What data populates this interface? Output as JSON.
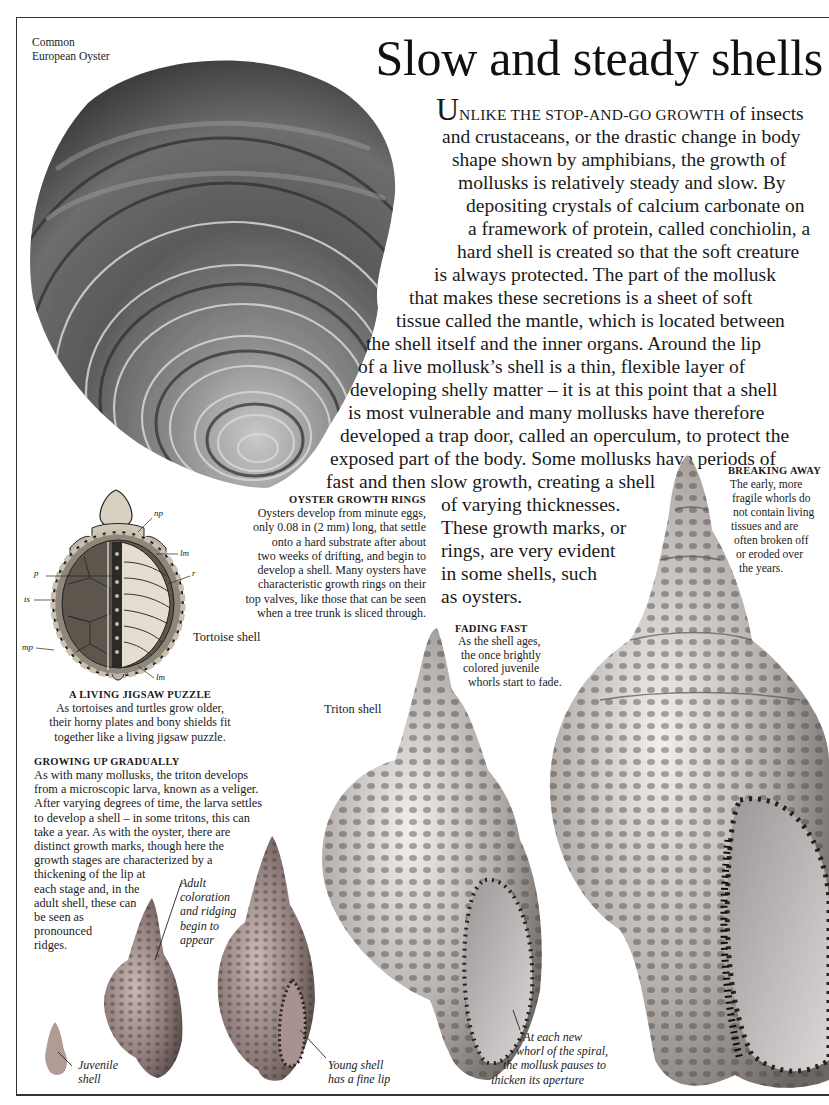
{
  "page": {
    "title": "Slow and steady shells",
    "border_color": "#333333"
  },
  "oyster": {
    "label_line1": "Common",
    "label_line2": "European Oyster"
  },
  "intro": {
    "dropcap": "U",
    "smallcaps_lead": "NLIKE THE STOP-AND-GO GROWTH",
    "lines": [
      " of insects",
      "and crustaceans, or the drastic change in body",
      "shape shown by amphibians, the growth of",
      "mollusks is relatively steady and slow. By",
      "depositing crystals of calcium carbonate on",
      "a framework of protein, called conchiolin, a",
      "hard shell is created so that the soft creature",
      "is always protected. The part of the mollusk",
      "that makes these secretions is a sheet of soft",
      "tissue called the mantle, which is located between",
      "the shell itself and the inner organs. Around the lip",
      "of a live mollusk’s shell is a thin, flexible layer of",
      "developing shelly matter – it is at this point that a shell",
      "is most vulnerable and many mollusks have therefore",
      "developed a trap door, called an operculum, to protect the",
      "exposed part of the body. Some mollusks have periods of",
      "fast and then slow growth, creating a shell",
      "of varying thicknesses.",
      "These growth marks, or",
      "rings, are very evident",
      "in some shells, such",
      "as oysters."
    ]
  },
  "oyster_growth_rings": {
    "heading": "OYSTER GROWTH RINGS",
    "lines": [
      "Oysters develop from minute eggs,",
      "only 0.08 in (2 mm) long, that settle",
      "onto a hard substrate after about",
      "two weeks of drifting, and begin to",
      "develop a shell. Many oysters have",
      "characteristic growth rings on their",
      "top valves, like those that can be seen",
      "when a tree trunk is sliced through."
    ]
  },
  "breaking_away": {
    "heading": "BREAKING AWAY",
    "lines": [
      "The early, more",
      "fragile whorls do",
      "not contain living",
      "tissues and are",
      "often broken off",
      "or eroded over",
      "the years."
    ]
  },
  "tortoise": {
    "caption": "Tortoise shell",
    "labels": {
      "np": "np",
      "lm_top": "lm",
      "p": "p",
      "r": "r",
      "ts": "ts",
      "mp": "mp",
      "lm_bottom": "lm"
    }
  },
  "living_jigsaw": {
    "heading": "A LIVING JIGSAW PUZZLE",
    "lines": [
      "As tortoises and turtles grow older,",
      "their horny plates and bony shields fit",
      "together like a living jigsaw puzzle."
    ]
  },
  "fading_fast": {
    "heading": "FADING FAST",
    "lines": [
      "As the shell ages,",
      "the once brightly",
      "colored juvenile",
      "whorls start to fade."
    ]
  },
  "triton": {
    "caption": "Triton shell"
  },
  "growing_up": {
    "heading": "GROWING UP GRADUALLY",
    "lines": [
      "As with many mollusks, the triton develops",
      "from a microscopic larva, known as a veliger.",
      "After varying degrees of time, the larva settles",
      "to develop a shell – in some tritons, this can",
      "take a year. As with the oyster, there are",
      "distinct growth marks, though here the",
      "growth stages are characterized by a",
      "thickening of the lip at",
      "each stage and, in the",
      "adult shell, these can",
      "be seen as",
      "pronounced",
      "ridges."
    ]
  },
  "annotations": {
    "adult_coloration": [
      "Adult",
      "coloration",
      "and ridging",
      "begin to",
      "appear"
    ],
    "juvenile": [
      "Juvenile",
      "shell"
    ],
    "young_shell": [
      "Young shell",
      "has a fine lip"
    ],
    "each_whorl": [
      "At each new",
      "whorl of the spiral,",
      "the mollusk pauses to",
      "thicken its aperture"
    ]
  }
}
